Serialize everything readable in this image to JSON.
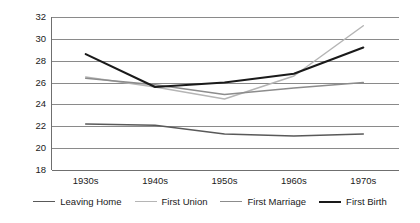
{
  "chart_data": {
    "type": "line",
    "title": "",
    "xlabel": "",
    "ylabel": "",
    "categories": [
      "1930s",
      "1940s",
      "1950s",
      "1960s",
      "1970s"
    ],
    "ylim": [
      18,
      32
    ],
    "yticks": [
      18,
      20,
      22,
      24,
      26,
      28,
      30,
      32
    ],
    "grid": true,
    "legend_position": "bottom",
    "series": [
      {
        "name": "Leaving Home",
        "color": "#595959",
        "values": [
          22.2,
          22.1,
          21.3,
          21.1,
          21.3
        ]
      },
      {
        "name": "First Union",
        "color": "#b5b5b5",
        "values": [
          26.5,
          25.6,
          24.5,
          26.6,
          31.2
        ]
      },
      {
        "name": "First Marriage",
        "color": "#8c8c8c",
        "values": [
          26.4,
          25.8,
          24.9,
          25.5,
          26.0
        ]
      },
      {
        "name": "First Birth",
        "color": "#1a1a1a",
        "values": [
          28.6,
          25.6,
          26.0,
          26.8,
          29.2
        ]
      }
    ]
  },
  "axis": {
    "y_tick_labels": [
      "32",
      "30",
      "28",
      "26",
      "24",
      "22",
      "20",
      "18"
    ],
    "x_tick_labels": [
      "1930s",
      "1940s",
      "1950s",
      "1960s",
      "1970s"
    ]
  },
  "legend": {
    "items": [
      {
        "label": "Leaving Home"
      },
      {
        "label": "First Union"
      },
      {
        "label": "First Marriage"
      },
      {
        "label": "First Birth"
      }
    ]
  },
  "colors": {
    "grid": "#8a8a8a",
    "axis": "#6f6f6f",
    "text": "#1a1a1a",
    "background": "#ffffff"
  }
}
